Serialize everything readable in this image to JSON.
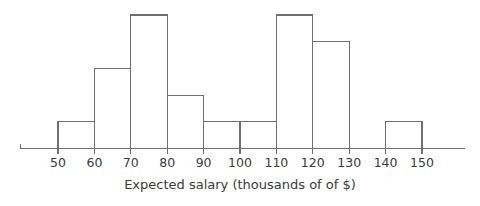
{
  "chart_data": {
    "type": "bar",
    "title": "",
    "subtitle": "",
    "xlabel": "Expected salary (thousands of of $)",
    "ylabel": "",
    "grid": false,
    "legend": null,
    "bin_width": 10,
    "bin_edges": [
      50,
      60,
      70,
      80,
      90,
      100,
      110,
      120,
      130,
      140,
      150
    ],
    "categories": [
      "50-60",
      "60-70",
      "70-80",
      "80-90",
      "90-100",
      "100-110",
      "110-120",
      "120-130",
      "130-140",
      "140-150"
    ],
    "values": [
      1,
      3,
      5,
      2,
      1,
      1,
      5,
      4,
      0,
      1
    ],
    "xlim": [
      44,
      156
    ],
    "ylim": [
      0,
      5
    ],
    "xticks": [
      50,
      60,
      70,
      80,
      90,
      100,
      110,
      120,
      130,
      140,
      150
    ],
    "xtick_labels": [
      "50",
      "60",
      "70",
      "80",
      "90",
      "100",
      "110",
      "120",
      "130",
      "140",
      "150"
    ],
    "yticks": [],
    "ytick_labels": [],
    "annotations": []
  },
  "style": {
    "stroke_color": "#6e6e6e",
    "text_color": "#3a3a3a",
    "background_color": "#ffffff",
    "bar_fill": "none"
  }
}
